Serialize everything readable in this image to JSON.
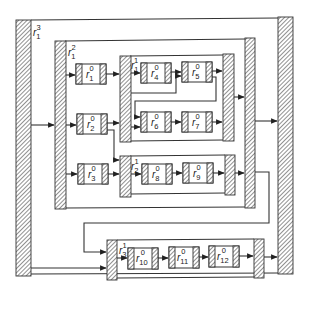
{
  "diagram": {
    "type": "hierarchical-block-diagram",
    "colors": {
      "stroke": "#333333",
      "hatch": "#555555",
      "background": "#ffffff"
    },
    "containers": [
      {
        "id": "r1_3",
        "base": "r",
        "sub": "1",
        "sup": "3",
        "level": 3
      },
      {
        "id": "r1_2",
        "base": "r",
        "sub": "1",
        "sup": "2",
        "level": 2
      },
      {
        "id": "r1_1",
        "base": "r",
        "sub": "1",
        "sup": "1",
        "level": 1
      },
      {
        "id": "r2_1",
        "base": "r",
        "sub": "2",
        "sup": "1",
        "level": 1
      },
      {
        "id": "r3_1",
        "base": "r",
        "sub": "3",
        "sup": "1",
        "level": 1
      }
    ],
    "blocks": [
      {
        "id": "r1_0",
        "base": "r",
        "sub": "1",
        "sup": "0"
      },
      {
        "id": "r2_0",
        "base": "r",
        "sub": "2",
        "sup": "0"
      },
      {
        "id": "r3_0",
        "base": "r",
        "sub": "3",
        "sup": "0"
      },
      {
        "id": "r4_0",
        "base": "r",
        "sub": "4",
        "sup": "0"
      },
      {
        "id": "r5_0",
        "base": "r",
        "sub": "5",
        "sup": "0"
      },
      {
        "id": "r6_0",
        "base": "r",
        "sub": "6",
        "sup": "0"
      },
      {
        "id": "r7_0",
        "base": "r",
        "sub": "7",
        "sup": "0"
      },
      {
        "id": "r8_0",
        "base": "r",
        "sub": "8",
        "sup": "0"
      },
      {
        "id": "r9_0",
        "base": "r",
        "sub": "9",
        "sup": "0"
      },
      {
        "id": "r10_0",
        "base": "r",
        "sub": "10",
        "sup": "0"
      },
      {
        "id": "r11_0",
        "base": "r",
        "sub": "11",
        "sup": "0"
      },
      {
        "id": "r12_0",
        "base": "r",
        "sub": "12",
        "sup": "0"
      }
    ],
    "edges": [
      [
        "r1_3.in",
        "r1_2.in"
      ],
      [
        "r1_3.in",
        "r3_1.in"
      ],
      [
        "r1_2.in",
        "r1_0"
      ],
      [
        "r1_2.in",
        "r2_0"
      ],
      [
        "r1_2.in",
        "r3_0"
      ],
      [
        "r1_0",
        "r1_1.in"
      ],
      [
        "r2_0",
        "r1_1.in"
      ],
      [
        "r2_0",
        "r2_1.in"
      ],
      [
        "r3_0",
        "r2_1.in"
      ],
      [
        "r1_1.in",
        "r4_0"
      ],
      [
        "r1_1.in",
        "r5_0"
      ],
      [
        "r1_1.in",
        "r6_0"
      ],
      [
        "r4_0",
        "r5_0"
      ],
      [
        "r5_0",
        "r1_1.out"
      ],
      [
        "r5_0",
        "r6_0"
      ],
      [
        "r6_0",
        "r7_0"
      ],
      [
        "r7_0",
        "r1_1.out"
      ],
      [
        "r2_1.in",
        "r8_0"
      ],
      [
        "r8_0",
        "r9_0"
      ],
      [
        "r9_0",
        "r2_1.out"
      ],
      [
        "r1_1.out",
        "r1_2.out"
      ],
      [
        "r2_1.out",
        "r1_2.out"
      ],
      [
        "r1_2.out",
        "r1_3.out"
      ],
      [
        "r1_2.out",
        "r3_1.in"
      ],
      [
        "r3_1.in",
        "r10_0"
      ],
      [
        "r10_0",
        "r11_0"
      ],
      [
        "r11_0",
        "r12_0"
      ],
      [
        "r12_0",
        "r3_1.out"
      ],
      [
        "r3_1.out",
        "r1_3.out"
      ]
    ]
  }
}
